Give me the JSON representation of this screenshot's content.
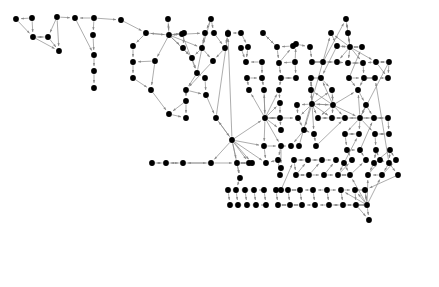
{
  "figure": {
    "type": "directed-graph",
    "title": "",
    "background_color": "#ffffff",
    "node_color": "#000000",
    "edge_color": "#8a8a8a",
    "node_radius": 2.9,
    "edge_width": 0.7,
    "arrowheads": true,
    "width": 439,
    "height": 287,
    "node_count": 203,
    "edge_count": 219
  },
  "chart_data": {
    "type": "scatter",
    "title": "",
    "xlabel": "",
    "ylabel": "",
    "xlim": [
      0,
      439
    ],
    "ylim": [
      0,
      287
    ],
    "grid": false,
    "legend": "none",
    "nodes": [
      [
        16,
        19
      ],
      [
        32,
        18
      ],
      [
        33,
        37
      ],
      [
        57,
        17
      ],
      [
        48,
        37
      ],
      [
        59,
        51
      ],
      [
        75,
        18
      ],
      [
        94,
        18
      ],
      [
        93,
        35
      ],
      [
        94,
        55
      ],
      [
        94,
        71
      ],
      [
        94,
        88
      ],
      [
        121,
        20
      ],
      [
        146,
        33
      ],
      [
        133,
        46
      ],
      [
        168,
        19
      ],
      [
        169,
        35
      ],
      [
        155,
        61
      ],
      [
        133,
        62
      ],
      [
        133,
        78
      ],
      [
        151,
        90
      ],
      [
        169,
        114
      ],
      [
        184,
        33
      ],
      [
        183,
        48
      ],
      [
        192,
        58
      ],
      [
        182,
        34
      ],
      [
        197,
        73
      ],
      [
        205,
        33
      ],
      [
        211,
        19
      ],
      [
        202,
        48
      ],
      [
        214,
        33
      ],
      [
        225,
        48
      ],
      [
        213,
        61
      ],
      [
        186,
        90
      ],
      [
        186,
        101
      ],
      [
        186,
        118
      ],
      [
        205,
        78
      ],
      [
        206,
        95
      ],
      [
        216,
        118
      ],
      [
        228,
        33
      ],
      [
        241,
        48
      ],
      [
        246,
        62
      ],
      [
        247,
        78
      ],
      [
        249,
        90
      ],
      [
        232,
        140
      ],
      [
        228,
        34
      ],
      [
        241,
        33
      ],
      [
        248,
        47
      ],
      [
        262,
        62
      ],
      [
        262,
        78
      ],
      [
        264,
        90
      ],
      [
        265,
        118
      ],
      [
        277,
        47
      ],
      [
        263,
        33
      ],
      [
        279,
        63
      ],
      [
        293,
        46
      ],
      [
        281,
        78
      ],
      [
        296,
        78
      ],
      [
        264,
        146
      ],
      [
        266,
        163
      ],
      [
        279,
        90
      ],
      [
        280,
        103
      ],
      [
        280,
        118
      ],
      [
        281,
        130
      ],
      [
        281,
        146
      ],
      [
        281,
        168
      ],
      [
        295,
        62
      ],
      [
        296,
        44
      ],
      [
        310,
        47
      ],
      [
        312,
        62
      ],
      [
        297,
        105
      ],
      [
        298,
        118
      ],
      [
        311,
        78
      ],
      [
        311,
        90
      ],
      [
        312,
        104
      ],
      [
        314,
        134
      ],
      [
        299,
        146
      ],
      [
        331,
        33
      ],
      [
        337,
        46
      ],
      [
        321,
        78
      ],
      [
        323,
        62
      ],
      [
        346,
        19
      ],
      [
        348,
        33
      ],
      [
        350,
        47
      ],
      [
        337,
        62
      ],
      [
        348,
        63
      ],
      [
        349,
        78
      ],
      [
        362,
        47
      ],
      [
        363,
        63
      ],
      [
        364,
        78
      ],
      [
        358,
        90
      ],
      [
        366,
        105
      ],
      [
        332,
        90
      ],
      [
        333,
        105
      ],
      [
        316,
        146
      ],
      [
        345,
        118
      ],
      [
        345,
        134
      ],
      [
        347,
        150
      ],
      [
        344,
        163
      ],
      [
        359,
        134
      ],
      [
        360,
        150
      ],
      [
        374,
        118
      ],
      [
        375,
        134
      ],
      [
        376,
        150
      ],
      [
        388,
        118
      ],
      [
        389,
        134
      ],
      [
        390,
        150
      ],
      [
        374,
        163
      ],
      [
        389,
        163
      ],
      [
        375,
        78
      ],
      [
        376,
        62
      ],
      [
        388,
        78
      ],
      [
        389,
        62
      ],
      [
        360,
        118
      ],
      [
        332,
        118
      ],
      [
        318,
        118
      ],
      [
        304,
        130
      ],
      [
        291,
        146
      ],
      [
        249,
        163
      ],
      [
        252,
        163
      ],
      [
        237,
        163
      ],
      [
        240,
        178
      ],
      [
        211,
        163
      ],
      [
        183,
        163
      ],
      [
        166,
        163
      ],
      [
        152,
        163
      ],
      [
        278,
        160
      ],
      [
        280,
        175
      ],
      [
        281,
        190
      ],
      [
        294,
        160
      ],
      [
        296,
        175
      ],
      [
        308,
        160
      ],
      [
        309,
        175
      ],
      [
        322,
        160
      ],
      [
        324,
        175
      ],
      [
        336,
        160
      ],
      [
        338,
        175
      ],
      [
        352,
        160
      ],
      [
        350,
        175
      ],
      [
        366,
        160
      ],
      [
        368,
        175
      ],
      [
        380,
        160
      ],
      [
        382,
        175
      ],
      [
        396,
        160
      ],
      [
        398,
        175
      ],
      [
        365,
        190
      ],
      [
        367,
        205
      ],
      [
        369,
        220
      ],
      [
        355,
        190
      ],
      [
        356,
        205
      ],
      [
        341,
        190
      ],
      [
        343,
        205
      ],
      [
        327,
        190
      ],
      [
        329,
        205
      ],
      [
        313,
        190
      ],
      [
        315,
        205
      ],
      [
        300,
        190
      ],
      [
        302,
        205
      ],
      [
        288,
        190
      ],
      [
        290,
        205
      ],
      [
        276,
        190
      ],
      [
        278,
        205
      ],
      [
        264,
        190
      ],
      [
        266,
        205
      ],
      [
        254,
        190
      ],
      [
        256,
        205
      ],
      [
        245,
        190
      ],
      [
        247,
        205
      ],
      [
        236,
        190
      ],
      [
        238,
        205
      ],
      [
        228,
        190
      ],
      [
        230,
        205
      ]
    ],
    "edges": [
      [
        1,
        2
      ],
      [
        3,
        4
      ],
      [
        3,
        5
      ],
      [
        4,
        5
      ],
      [
        6,
        9
      ],
      [
        7,
        8
      ],
      [
        8,
        9
      ],
      [
        9,
        10
      ],
      [
        10,
        11
      ],
      [
        12,
        13
      ],
      [
        13,
        14
      ],
      [
        15,
        16
      ],
      [
        16,
        17
      ],
      [
        17,
        18
      ],
      [
        18,
        19
      ],
      [
        19,
        20
      ],
      [
        20,
        21
      ],
      [
        22,
        23
      ],
      [
        23,
        24
      ],
      [
        25,
        26
      ],
      [
        26,
        27
      ],
      [
        28,
        29
      ],
      [
        30,
        31
      ],
      [
        32,
        33
      ],
      [
        34,
        35
      ],
      [
        36,
        37
      ],
      [
        38,
        39
      ],
      [
        40,
        41
      ],
      [
        42,
        43
      ],
      [
        44,
        45
      ],
      [
        46,
        47
      ],
      [
        48,
        49
      ],
      [
        50,
        51
      ],
      [
        52,
        53
      ],
      [
        54,
        55
      ],
      [
        56,
        57
      ],
      [
        58,
        59
      ],
      [
        60,
        61
      ],
      [
        62,
        63
      ],
      [
        64,
        65
      ],
      [
        66,
        67
      ],
      [
        68,
        69
      ],
      [
        70,
        71
      ],
      [
        72,
        73
      ],
      [
        74,
        75
      ],
      [
        76,
        77
      ],
      [
        78,
        79
      ],
      [
        80,
        81
      ],
      [
        82,
        83
      ],
      [
        84,
        85
      ],
      [
        86,
        87
      ],
      [
        88,
        89
      ],
      [
        90,
        91
      ],
      [
        92,
        93
      ],
      [
        94,
        95
      ],
      [
        96,
        97
      ],
      [
        98,
        99
      ],
      [
        100,
        101
      ],
      [
        102,
        103
      ],
      [
        104,
        105
      ],
      [
        106,
        107
      ],
      [
        108,
        109
      ],
      [
        110,
        111
      ],
      [
        112,
        113
      ],
      [
        114,
        115
      ],
      [
        116,
        117
      ],
      [
        118,
        119
      ],
      [
        120,
        121
      ],
      [
        122,
        123
      ],
      [
        124,
        125
      ],
      [
        126,
        127
      ],
      [
        128,
        129
      ],
      [
        130,
        131
      ],
      [
        132,
        133
      ],
      [
        134,
        135
      ],
      [
        136,
        137
      ],
      [
        138,
        139
      ],
      [
        140,
        141
      ],
      [
        142,
        143
      ],
      [
        144,
        145
      ],
      [
        146,
        147
      ],
      [
        148,
        149
      ],
      [
        150,
        151
      ],
      [
        152,
        153
      ],
      [
        154,
        155
      ],
      [
        156,
        157
      ],
      [
        158,
        159
      ],
      [
        160,
        161
      ],
      [
        162,
        163
      ],
      [
        164,
        165
      ],
      [
        166,
        167
      ],
      [
        168,
        169
      ],
      [
        170,
        171
      ],
      [
        172,
        173
      ],
      [
        174,
        175
      ],
      [
        176,
        177
      ],
      [
        178,
        179
      ],
      [
        180,
        181
      ],
      [
        182,
        183
      ],
      [
        184,
        185
      ],
      [
        186,
        187
      ],
      [
        188,
        189
      ],
      [
        190,
        191
      ],
      [
        192,
        193
      ],
      [
        194,
        195
      ],
      [
        196,
        197
      ],
      [
        198,
        199
      ],
      [
        200,
        201
      ]
    ]
  },
  "graph": {
    "clusters": [
      {
        "name": "left-sparse-cluster",
        "description": "Isolated and small-chain nodes at upper left",
        "node_indices": [
          0,
          1,
          2,
          3,
          4,
          5,
          6,
          7,
          8,
          9,
          10,
          11
        ]
      },
      {
        "name": "center-dense-cluster",
        "description": "Large densely connected hub region in the middle",
        "node_indices": [
          12,
          13,
          14,
          15,
          16,
          17,
          18,
          19,
          20,
          21
        ]
      },
      {
        "name": "right-hub-cluster",
        "description": "Right-side hub with radial fan edges",
        "node_indices": [
          77,
          78,
          79,
          80,
          81,
          82,
          83
        ]
      },
      {
        "name": "bottom-right-cluster",
        "description": "Lower right lattice of nodes and short chains",
        "node_indices": [
          150,
          151,
          152,
          153,
          154,
          155
        ]
      }
    ]
  }
}
